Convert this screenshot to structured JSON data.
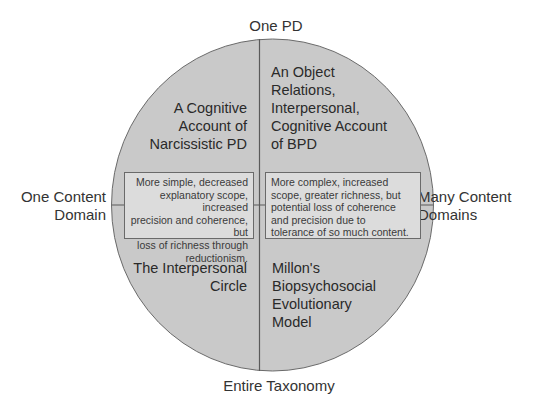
{
  "axes": {
    "top": "One PD",
    "bottom": "Entire Taxonomy",
    "left": [
      "One Content",
      "Domain"
    ],
    "right": [
      "Many Content",
      "Domains"
    ]
  },
  "quadrants": {
    "top_left": [
      "A Cognitive",
      "Account of",
      "Narcissistic PD"
    ],
    "top_right": [
      "An Object",
      "Relations,",
      "Interpersonal,",
      "Cognitive Account",
      "of BPD"
    ],
    "bottom_left": [
      "The Interpersonal",
      "Circle"
    ],
    "bottom_right": [
      "Millon's",
      "Biopsychosocial",
      "Evolutionary",
      "Model"
    ]
  },
  "boxes": {
    "left": [
      "More simple, decreased",
      "explanatory scope, increased",
      "precision and coherence, but",
      "loss of richness through",
      "reductionism."
    ],
    "right": [
      "More complex, increased",
      "scope, greater richness, but",
      "potential loss of coherence",
      "and precision due to",
      "tolerance of so much content."
    ]
  },
  "colors": {
    "circle_fill": "#c9c9c9",
    "box_fill": "#dcdcdc",
    "line": "#666666"
  }
}
